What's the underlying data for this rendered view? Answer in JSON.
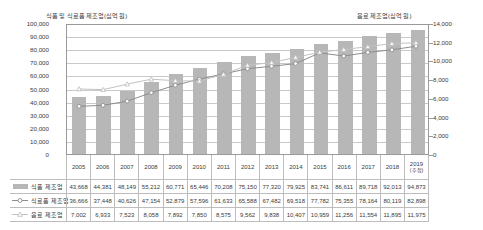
{
  "chart_data": {
    "type": "bar",
    "title": "",
    "xlabel": "",
    "ylabel": "식품 및 식료품 제조업(십억 원)",
    "y2label": "음료 제조업(십억 원)",
    "ylim": [
      0,
      100000
    ],
    "y2lim": [
      0,
      14000
    ],
    "grid": true,
    "legend_position": "table-left",
    "categories": [
      "2005",
      "2006",
      "2007",
      "2008",
      "2009",
      "2010",
      "2011",
      "2012",
      "2013",
      "2014",
      "2015",
      "2016",
      "2017",
      "2018",
      "2019"
    ],
    "category_sublabels": [
      "",
      "",
      "",
      "",
      "",
      "",
      "",
      "",
      "",
      "",
      "",
      "",
      "",
      "",
      "(추정)"
    ],
    "y_ticks": [
      "0",
      "10,000",
      "20,000",
      "30,000",
      "40,000",
      "50,000",
      "60,000",
      "70,000",
      "80,000",
      "90,000",
      "100,000"
    ],
    "y2_ticks": [
      "0",
      "2,000",
      "4,000",
      "6,000",
      "8,000",
      "10,000",
      "12,000",
      "14,000"
    ],
    "series": [
      {
        "name": "식품 제조업",
        "axis": "left",
        "render": "bar",
        "color": "#b7b7b7",
        "values": [
          43668,
          44381,
          48149,
          55212,
          60771,
          65446,
          70208,
          75150,
          77320,
          79925,
          83741,
          86611,
          89718,
          92013,
          94873
        ],
        "labels": [
          "43,668",
          "44,381",
          "48,149",
          "55,212",
          "60,771",
          "65,446",
          "70,208",
          "75,150",
          "77,320",
          "79,925",
          "83,741",
          "86,611",
          "89,718",
          "92,013",
          "94,873"
        ]
      },
      {
        "name": "식료품 제조업",
        "axis": "left",
        "render": "line-circle",
        "color": "#8d8d8d",
        "values": [
          36666,
          37448,
          40626,
          47154,
          52879,
          57596,
          61633,
          65588,
          67482,
          69518,
          77782,
          75355,
          78164,
          80119,
          82898
        ],
        "labels": [
          "36,666",
          "37,448",
          "40,626",
          "47,154",
          "52,879",
          "57,596",
          "61,633",
          "65,588",
          "67,482",
          "69,518",
          "77,782",
          "75,355",
          "78,164",
          "80,119",
          "82,898"
        ]
      },
      {
        "name": "음료 제조업",
        "axis": "right",
        "render": "line-triangle",
        "color": "#c2c2c2",
        "values": [
          7002,
          6933,
          7523,
          8058,
          7892,
          7850,
          8575,
          9562,
          9838,
          10407,
          10959,
          11256,
          11554,
          11895,
          11975
        ],
        "labels": [
          "7,002",
          "6,933",
          "7,523",
          "8,058",
          "7,892",
          "7,850",
          "8,575",
          "9,562",
          "9,838",
          "10,407",
          "10,959",
          "11,256",
          "11,554",
          "11,895",
          "11,975"
        ]
      }
    ]
  }
}
